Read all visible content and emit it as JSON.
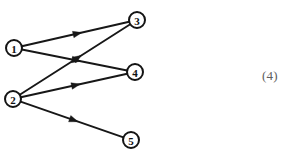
{
  "figure": {
    "background_color": "#ffffff",
    "ink_color": "#171717",
    "label_color": "#5e5e5e",
    "width": 297,
    "height": 156
  },
  "equation_number": {
    "text": "(4)",
    "x": 262,
    "y": 69
  },
  "diagram": {
    "type": "directed-graph",
    "node_radius": 8,
    "nodes": [
      {
        "id": "1",
        "label": "1",
        "cx": 14,
        "cy": 48
      },
      {
        "id": "2",
        "label": "2",
        "cx": 13,
        "cy": 99
      },
      {
        "id": "3",
        "label": "3",
        "cx": 137,
        "cy": 20
      },
      {
        "id": "4",
        "label": "4",
        "cx": 135,
        "cy": 72
      },
      {
        "id": "5",
        "label": "5",
        "cx": 131,
        "cy": 140
      }
    ],
    "edges": [
      {
        "id": "e1",
        "from": "1",
        "to": "3",
        "label": "1-to-3"
      },
      {
        "id": "e2",
        "from": "1",
        "to": "4",
        "label": "1-to-4"
      },
      {
        "id": "e3",
        "from": "2",
        "to": "3",
        "label": "2-to-3"
      },
      {
        "id": "e4",
        "from": "2",
        "to": "4",
        "label": "2-to-4"
      },
      {
        "id": "e5",
        "from": "2",
        "to": "5",
        "label": "2-to-5"
      }
    ]
  }
}
